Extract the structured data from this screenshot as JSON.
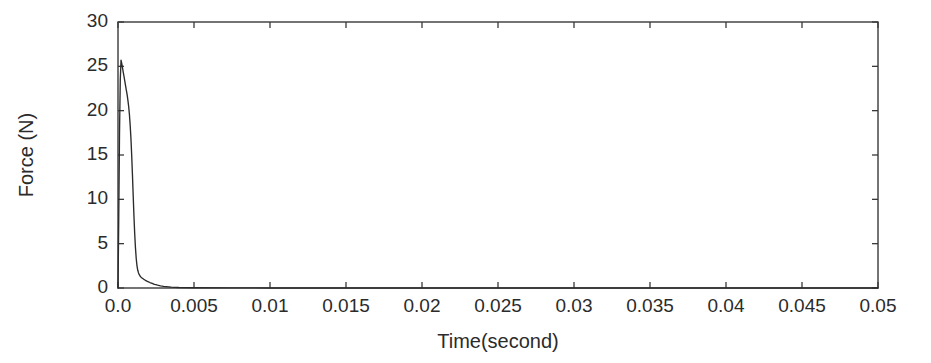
{
  "chart_data": {
    "type": "line",
    "title": "",
    "xlabel": "Time(second)",
    "ylabel": "Force (N)",
    "xlim": [
      0.0,
      0.05
    ],
    "ylim": [
      0,
      30
    ],
    "grid": false,
    "legend": null,
    "xticks": [
      0.0,
      0.005,
      0.01,
      0.015,
      0.02,
      0.025,
      0.03,
      0.035,
      0.04,
      0.045,
      0.05
    ],
    "xticklabels": [
      "0.0",
      "0.005",
      "0.01",
      "0.015",
      "0.02",
      "0.025",
      "0.03",
      "0.035",
      "0.04",
      "0.045",
      "0.05"
    ],
    "yticks": [
      0,
      5,
      10,
      15,
      20,
      25,
      30
    ],
    "yticklabels": [
      "0",
      "5",
      "10",
      "15",
      "20",
      "25",
      "30"
    ],
    "line_color": "#2b2b2b",
    "frame_color": "#3a3a3a",
    "series": [
      {
        "name": "Force",
        "x": [
          0.0,
          5e-05,
          0.0001,
          0.00015,
          0.0002,
          0.00025,
          0.0003,
          0.00035,
          0.0004,
          0.00045,
          0.0005,
          0.00055,
          0.0006,
          0.00065,
          0.0007,
          0.00075,
          0.0008,
          0.00085,
          0.0009,
          0.00095,
          0.001,
          0.00105,
          0.0011,
          0.00115,
          0.0012,
          0.00125,
          0.0013,
          0.00135,
          0.0014,
          0.00145,
          0.0015,
          0.0016,
          0.0017,
          0.0018,
          0.0019,
          0.002,
          0.0021,
          0.0022,
          0.0023,
          0.0024,
          0.0025,
          0.0026,
          0.0028,
          0.003,
          0.0035,
          0.004,
          0.005,
          0.0075,
          0.01,
          0.015,
          0.02,
          0.025,
          0.03,
          0.035,
          0.04,
          0.045,
          0.05
        ],
        "y": [
          0.0,
          8.0,
          17.5,
          23.5,
          25.7,
          25.3,
          24.8,
          24.3,
          23.8,
          23.3,
          22.8,
          22.3,
          21.8,
          21.2,
          20.5,
          19.6,
          18.4,
          16.9,
          15.0,
          12.8,
          10.4,
          8.1,
          6.1,
          4.5,
          3.3,
          2.5,
          2.0,
          1.7,
          1.5,
          1.35,
          1.25,
          1.1,
          0.98,
          0.87,
          0.78,
          0.7,
          0.62,
          0.55,
          0.48,
          0.42,
          0.37,
          0.32,
          0.24,
          0.18,
          0.1,
          0.06,
          0.03,
          0.01,
          0.006,
          0.004,
          0.003,
          0.003,
          0.002,
          0.002,
          0.002,
          0.001,
          0.001
        ]
      }
    ]
  }
}
